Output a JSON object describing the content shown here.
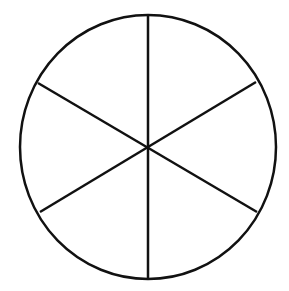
{
  "diagram": {
    "shape": "circle divided into equal sectors",
    "sectors": 6,
    "stroke_color": "#111111",
    "background_color": "#ffffff",
    "stroke_width": 2.5
  }
}
